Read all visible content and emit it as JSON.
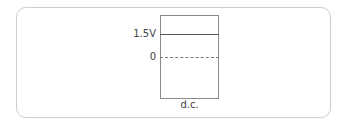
{
  "diagram": {
    "type": "voltage-level-diagram",
    "y_labels": {
      "top": "1.5V",
      "zero": "0"
    },
    "x_label": "d.c.",
    "levels": [
      {
        "name": "dc-level",
        "value": "1.5V",
        "style": "solid",
        "color": "#555555"
      },
      {
        "name": "zero-reference",
        "value": "0",
        "style": "dashed",
        "color": "#777777"
      }
    ],
    "colors": {
      "frame_border": "#cfcfcf",
      "plot_border": "#8a8a8a",
      "text": "#444444"
    }
  }
}
